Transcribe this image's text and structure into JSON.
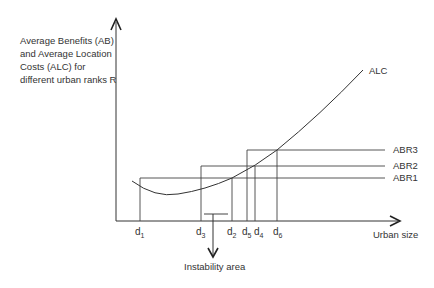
{
  "y_axis_label": [
    "Average Benefits (AB)",
    "and Average Location",
    "Costs (ALC) for",
    "different urban ranks R"
  ],
  "x_axis_label": "Urban size",
  "curve_label": "ALC",
  "ab_lines": [
    {
      "label": "ABR3",
      "y": 150
    },
    {
      "label": "ABR2",
      "y": 166
    },
    {
      "label": "ABR1",
      "y": 178
    }
  ],
  "ticks": [
    {
      "base": "d",
      "sub": "1",
      "x": 140
    },
    {
      "base": "d",
      "sub": "3",
      "x": 201
    },
    {
      "base": "d",
      "sub": "2",
      "x": 232
    },
    {
      "base": "d",
      "sub": "5",
      "x": 247
    },
    {
      "base": "d",
      "sub": "4",
      "x": 255
    },
    {
      "base": "d",
      "sub": "6",
      "x": 277
    }
  ],
  "annotation": "Instability area",
  "colors": {
    "line": "#333333",
    "text": "#333333"
  }
}
